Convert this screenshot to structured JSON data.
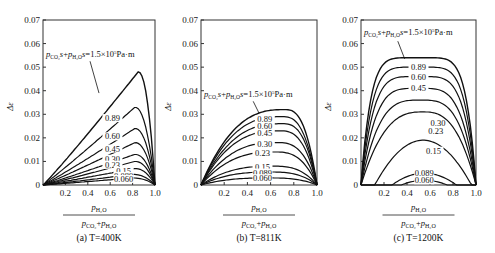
{
  "chart_data": [
    {
      "type": "line",
      "caption": "(a)  T=400K",
      "title": "",
      "xlabel": "p_H2O / (p_CO2 + p_H2O)",
      "ylabel": "Δε",
      "xlim": [
        0,
        1.0
      ],
      "ylim": [
        0,
        0.07
      ],
      "xticks": [
        "0.2",
        "0.4",
        "0.6",
        "0.8",
        "1.0"
      ],
      "yticks": [
        "0",
        "0.01",
        "0.02",
        "0.03",
        "0.04",
        "0.05",
        "0.06",
        "0.07"
      ],
      "annotation": "p_CO2 s + p_H2O s = 1.5×10^5 Pa·m",
      "series": [
        {
          "name": "1.5",
          "peak_x": 0.85,
          "peak_y": 0.048
        },
        {
          "name": "0.89",
          "peak_x": 0.82,
          "peak_y": 0.033
        },
        {
          "name": "0.60",
          "peak_x": 0.82,
          "peak_y": 0.024
        },
        {
          "name": "0.45",
          "peak_x": 0.82,
          "peak_y": 0.018
        },
        {
          "name": "0.30",
          "peak_x": 0.82,
          "peak_y": 0.013
        },
        {
          "name": "0.23",
          "peak_x": 0.82,
          "peak_y": 0.01
        },
        {
          "name": "0.15",
          "peak_x": 0.82,
          "peak_y": 0.007
        },
        {
          "name": "0.089",
          "peak_x": 0.8,
          "peak_y": 0.0045
        },
        {
          "name": "0.060",
          "peak_x": 0.8,
          "peak_y": 0.003
        }
      ]
    },
    {
      "type": "line",
      "caption": "(b)  T=811K",
      "title": "",
      "xlabel": "p_H2O / (p_CO2 + p_H2O)",
      "ylabel": "Δε",
      "xlim": [
        0,
        1.0
      ],
      "ylim": [
        0,
        0.07
      ],
      "xticks": [
        "0.2",
        "0.4",
        "0.6",
        "0.8",
        "1.0"
      ],
      "yticks": [
        "0",
        "0.01",
        "0.02",
        "0.03",
        "0.04",
        "0.05",
        "0.06",
        "0.07"
      ],
      "annotation": "p_CO2 s + p_H2O s = 1.5×10^5 Pa·m",
      "series": [
        {
          "name": "1.5",
          "peak_x": 0.72,
          "peak_y": 0.032
        },
        {
          "name": "0.89",
          "peak_x": 0.7,
          "peak_y": 0.029
        },
        {
          "name": "0.60",
          "peak_x": 0.7,
          "peak_y": 0.026
        },
        {
          "name": "0.45",
          "peak_x": 0.68,
          "peak_y": 0.023
        },
        {
          "name": "0.30",
          "peak_x": 0.66,
          "peak_y": 0.018
        },
        {
          "name": "0.23",
          "peak_x": 0.64,
          "peak_y": 0.014
        },
        {
          "name": "0.15",
          "peak_x": 0.62,
          "peak_y": 0.008
        },
        {
          "name": "0.089",
          "peak_x": 0.6,
          "peak_y": 0.0055
        },
        {
          "name": "0.060",
          "peak_x": 0.58,
          "peak_y": 0.003
        }
      ]
    },
    {
      "type": "line",
      "caption": "(c)  T=1200K",
      "title": "",
      "xlabel": "p_H2O / (p_CO2 + p_H2O)",
      "ylabel": "Δε",
      "xlim": [
        0,
        1.0
      ],
      "ylim": [
        0,
        0.07
      ],
      "xticks": [
        "0.2",
        "0.4",
        "0.6",
        "0.8",
        "1.0"
      ],
      "yticks": [
        "0",
        "0.01",
        "0.02",
        "0.03",
        "0.04",
        "0.05",
        "0.06",
        "0.07"
      ],
      "annotation": "p_CO2 s + p_H2O s = 1.5×10^5 Pa·m",
      "series": [
        {
          "name": "1.5",
          "peak_x": 0.5,
          "peak_y": 0.054
        },
        {
          "name": "0.89",
          "peak_x": 0.5,
          "peak_y": 0.05
        },
        {
          "name": "0.60",
          "peak_x": 0.5,
          "peak_y": 0.046
        },
        {
          "name": "0.45",
          "peak_x": 0.5,
          "peak_y": 0.041
        },
        {
          "name": "0.30",
          "peak_x": 0.52,
          "peak_y": 0.036
        },
        {
          "name": "0.23",
          "peak_x": 0.54,
          "peak_y": 0.031
        },
        {
          "name": "0.15",
          "peak_x": 0.54,
          "peak_y": 0.019
        },
        {
          "name": "0.089",
          "peak_x": 0.55,
          "peak_y": 0.005
        },
        {
          "name": "0.060",
          "peak_x": 0.55,
          "peak_y": 0.002
        }
      ]
    }
  ],
  "labels": {
    "ylabel": "Δε",
    "annotation_main": "1.5×10",
    "annotation_exp": "5",
    "annotation_unit": "Pa·m",
    "caption_a": "(a)  T=400K",
    "caption_b": "(b)  T=811K",
    "caption_c": "(c)  T=1200K"
  }
}
